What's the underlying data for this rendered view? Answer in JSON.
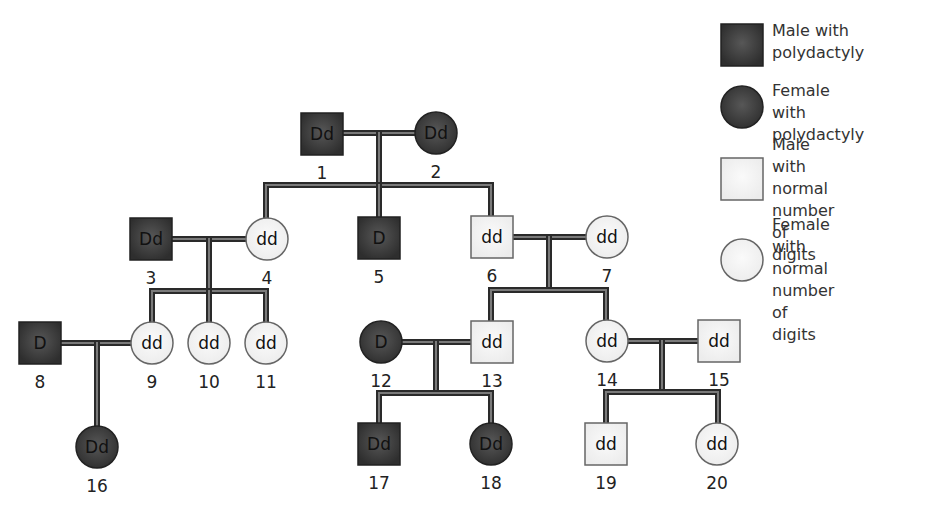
{
  "colors": {
    "affected_fill": "#3a3a3a",
    "affected_fill_light": "#555555",
    "normal_fill": "#f4f4f4",
    "normal_stroke": "#666666",
    "affected_stroke": "#222222"
  },
  "legend": [
    {
      "shape": "square",
      "affected": true,
      "label": "Male with\npolydactyly",
      "x": 721,
      "y": 24,
      "textX": 772,
      "textY": 20
    },
    {
      "shape": "circle",
      "affected": true,
      "label": "Female with\npolydactyly",
      "x": 721,
      "y": 86,
      "textX": 772,
      "textY": 80
    },
    {
      "shape": "square",
      "affected": false,
      "label": "Male with\nnormal number\nof digits",
      "x": 721,
      "y": 158,
      "textX": 772,
      "textY": 134
    },
    {
      "shape": "circle",
      "affected": false,
      "label": "Female with\nnormal number\nof digits",
      "x": 721,
      "y": 239,
      "textX": 772,
      "textY": 214
    }
  ],
  "individuals": [
    {
      "id": "1",
      "sex": "male",
      "affected": true,
      "genotype": "Dd",
      "cx": 322,
      "cy": 134
    },
    {
      "id": "2",
      "sex": "female",
      "affected": true,
      "genotype": "Dd",
      "cx": 436,
      "cy": 133
    },
    {
      "id": "3",
      "sex": "male",
      "affected": true,
      "genotype": "Dd",
      "cx": 151,
      "cy": 239
    },
    {
      "id": "4",
      "sex": "female",
      "affected": false,
      "genotype": "dd",
      "cx": 267,
      "cy": 239
    },
    {
      "id": "5",
      "sex": "male",
      "affected": true,
      "genotype": "D",
      "cx": 379,
      "cy": 238
    },
    {
      "id": "6",
      "sex": "male",
      "affected": false,
      "genotype": "dd",
      "cx": 492,
      "cy": 237
    },
    {
      "id": "7",
      "sex": "female",
      "affected": false,
      "genotype": "dd",
      "cx": 607,
      "cy": 237
    },
    {
      "id": "8",
      "sex": "male",
      "affected": true,
      "genotype": "D",
      "cx": 40,
      "cy": 343
    },
    {
      "id": "9",
      "sex": "female",
      "affected": false,
      "genotype": "dd",
      "cx": 152,
      "cy": 343
    },
    {
      "id": "10",
      "sex": "female",
      "affected": false,
      "genotype": "dd",
      "cx": 209,
      "cy": 343
    },
    {
      "id": "11",
      "sex": "female",
      "affected": false,
      "genotype": "dd",
      "cx": 266,
      "cy": 343
    },
    {
      "id": "12",
      "sex": "female",
      "affected": true,
      "genotype": "D",
      "cx": 381,
      "cy": 342
    },
    {
      "id": "13",
      "sex": "male",
      "affected": false,
      "genotype": "dd",
      "cx": 492,
      "cy": 342
    },
    {
      "id": "14",
      "sex": "female",
      "affected": false,
      "genotype": "dd",
      "cx": 607,
      "cy": 341
    },
    {
      "id": "15",
      "sex": "male",
      "affected": false,
      "genotype": "dd",
      "cx": 719,
      "cy": 341
    },
    {
      "id": "16",
      "sex": "female",
      "affected": true,
      "genotype": "Dd",
      "cx": 97,
      "cy": 447
    },
    {
      "id": "17",
      "sex": "male",
      "affected": true,
      "genotype": "Dd",
      "cx": 379,
      "cy": 444
    },
    {
      "id": "18",
      "sex": "female",
      "affected": true,
      "genotype": "Dd",
      "cx": 491,
      "cy": 444
    },
    {
      "id": "19",
      "sex": "male",
      "affected": false,
      "genotype": "dd",
      "cx": 606,
      "cy": 444
    },
    {
      "id": "20",
      "sex": "female",
      "affected": false,
      "genotype": "dd",
      "cx": 717,
      "cy": 444
    }
  ],
  "lines": [
    {
      "d": "M343 133 L415 133"
    },
    {
      "d": "M379 133 L379 185"
    },
    {
      "d": "M266 218 L266 185 L491 185 L491 216"
    },
    {
      "d": "M379 185 L379 217"
    },
    {
      "d": "M172 239 L246 239"
    },
    {
      "d": "M209 239 L209 291"
    },
    {
      "d": "M152 322 L152 291 L266 291 L266 322"
    },
    {
      "d": "M209 291 L209 322"
    },
    {
      "d": "M513 237 L586 237"
    },
    {
      "d": "M549 237 L549 290"
    },
    {
      "d": "M491 321 L491 290 L606 290 L606 320"
    },
    {
      "d": "M61 343 L131 343"
    },
    {
      "d": "M97 343 L97 426"
    },
    {
      "d": "M402 342 L471 342"
    },
    {
      "d": "M436 342 L436 393"
    },
    {
      "d": "M379 423 L379 393 L491 393 L491 423"
    },
    {
      "d": "M628 341 L698 341"
    },
    {
      "d": "M662 341 L662 392"
    },
    {
      "d": "M606 423 L606 392 L718 392 L718 423"
    }
  ]
}
